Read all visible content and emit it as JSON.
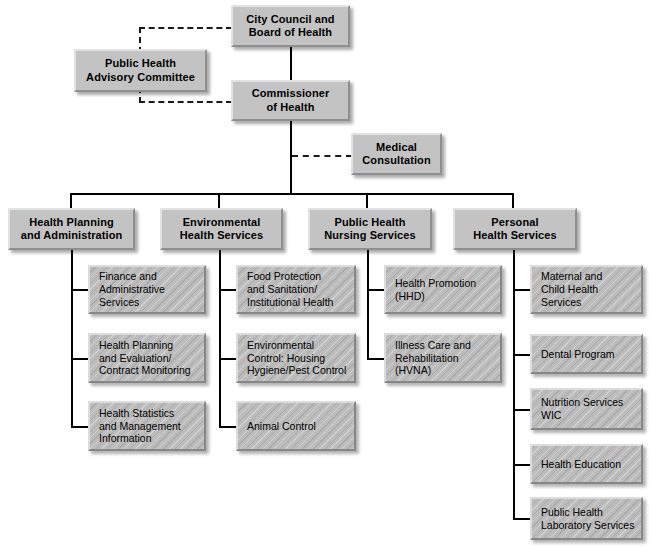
{
  "chart_title": "Health Department Organizational Chart",
  "colors": {
    "box_fill": "#c3c3c3",
    "leaf_fill": "#bcbcbc",
    "line": "#000000",
    "page_background": "#ffffff"
  },
  "top": {
    "city_council": "City Council and\nBoard of Health",
    "advisory_committee": "Public Health\nAdvisory Committee",
    "commissioner": "Commissioner\nof Health",
    "medical_consultation": "Medical\nConsultation"
  },
  "divisions": [
    {
      "id": "health-planning-and-administration",
      "label": "Health Planning\nand Administration",
      "units": [
        "Finance and\nAdministrative\nServices",
        "Health Planning\nand Evaluation/\nContract Monitoring",
        "Health Statistics\nand Management\nInformation"
      ]
    },
    {
      "id": "environmental-health-services",
      "label": "Environmental\nHealth Services",
      "units": [
        "Food Protection\nand Sanitation/\nInstitutional Health",
        "Environmental\nControl: Housing\nHygiene/Pest Control",
        "Animal Control"
      ]
    },
    {
      "id": "public-health-nursing-services",
      "label": "Public Health\nNursing Services",
      "units": [
        "Health Promotion\n(HHD)",
        "Illness Care and\nRehabilitation\n(HVNA)"
      ]
    },
    {
      "id": "personal-health-services",
      "label": "Personal\nHealth Services",
      "units": [
        "Maternal and\nChild Health\nServices",
        "Dental Program",
        "Nutrition Services\nWIC",
        "Health Education",
        "Public Health\nLaboratory Services"
      ]
    }
  ]
}
